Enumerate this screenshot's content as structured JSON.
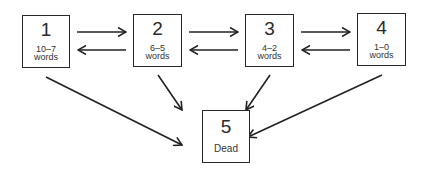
{
  "diagram": {
    "type": "state-transition",
    "nodes": [
      {
        "id": "1",
        "label": "1",
        "range": "10–7",
        "unit": "words"
      },
      {
        "id": "2",
        "label": "2",
        "range": "6–5",
        "unit": "words"
      },
      {
        "id": "3",
        "label": "3",
        "range": "4–2",
        "unit": "words"
      },
      {
        "id": "4",
        "label": "4",
        "range": "1–0",
        "unit": "words"
      },
      {
        "id": "5",
        "label": "5",
        "description": "Dead"
      }
    ],
    "edges": [
      {
        "from": "1",
        "to": "2"
      },
      {
        "from": "2",
        "to": "1"
      },
      {
        "from": "2",
        "to": "3"
      },
      {
        "from": "3",
        "to": "2"
      },
      {
        "from": "3",
        "to": "4"
      },
      {
        "from": "4",
        "to": "3"
      },
      {
        "from": "1",
        "to": "5"
      },
      {
        "from": "2",
        "to": "5"
      },
      {
        "from": "3",
        "to": "5"
      },
      {
        "from": "4",
        "to": "5"
      }
    ]
  }
}
